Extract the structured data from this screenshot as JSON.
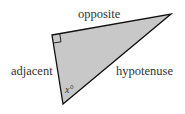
{
  "diagram": {
    "type": "right-triangle",
    "labels": {
      "opposite": "opposite",
      "adjacent": "adjacent",
      "hypotenuse": "hypotenuse",
      "angle": "x°"
    },
    "colors": {
      "fill": "#c8c8c8",
      "stroke": "#111111",
      "text": "#333333"
    }
  }
}
